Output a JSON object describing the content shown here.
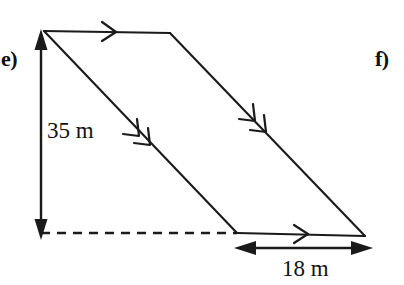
{
  "figure": {
    "type": "parallelogram-with-dimensions",
    "problem_labels": [
      {
        "name": "e",
        "text": "e)"
      },
      {
        "name": "f",
        "text": "f)"
      }
    ],
    "dimensions": [
      {
        "name": "height",
        "text": "35 m",
        "value": 35,
        "unit": "m",
        "orientation": "vertical",
        "position": "left"
      },
      {
        "name": "base",
        "text": "18 m",
        "value": 18,
        "unit": "m",
        "orientation": "horizontal",
        "position": "bottom-right"
      }
    ],
    "vertices": {
      "top_left": [
        44,
        31
      ],
      "top_right": [
        170,
        33
      ],
      "bottom_right": [
        365,
        236
      ],
      "bottom_left": [
        237,
        233
      ]
    },
    "tick_marks": {
      "top_edge": 1,
      "bottom_edge": 1,
      "left_slant_edge": 2,
      "right_slant_edge": 2
    },
    "dashed_extension_line": {
      "from": [
        41,
        233
      ],
      "to": [
        237,
        233
      ]
    },
    "colors": {
      "stroke": "#1a1a1a",
      "text": "#121212",
      "background": "#ffffff"
    }
  }
}
